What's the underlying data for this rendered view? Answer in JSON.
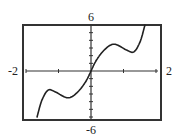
{
  "chart_data": {
    "type": "line",
    "title": "",
    "xlabel": "",
    "ylabel": "",
    "xlim": [
      -2,
      2
    ],
    "ylim": [
      -6,
      6
    ],
    "xscale_ticks": 1,
    "yscale_ticks": 1,
    "grid": false,
    "legend": null,
    "window_labels": {
      "xmin": "-2",
      "xmax": "2",
      "ymin": "-6",
      "ymax": "6"
    },
    "series": [
      {
        "name": "f(x)",
        "x": [
          -1.66,
          -1.51,
          -1.32,
          -1.11,
          -0.71,
          -0.4,
          -0.15,
          0.0,
          0.15,
          0.4,
          0.71,
          1.11,
          1.32,
          1.51,
          1.66
        ],
        "y": [
          -6.0,
          -3.8,
          -2.5,
          -2.7,
          -3.5,
          -2.7,
          -1.3,
          0.0,
          1.3,
          2.7,
          3.5,
          2.7,
          2.5,
          3.8,
          6.0
        ]
      }
    ],
    "annotations": []
  },
  "style": {
    "frame_color": "#333333",
    "axis_color": "#333333",
    "curve_color": "#222222"
  }
}
